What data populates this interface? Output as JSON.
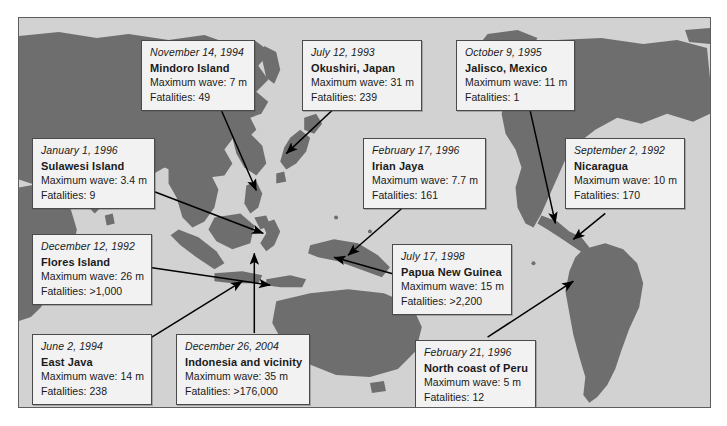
{
  "figure": {
    "type": "annotated-world-map",
    "title": "",
    "ocean_color": "#d2d2d2",
    "land_color": "#6e6e6e",
    "callout_bg": "#f2f2f2",
    "callout_border": "#4a4a4a",
    "arrow_color": "#000000",
    "page_bg": "#ffffff"
  },
  "labels": {
    "wave_prefix": "Maximum wave: ",
    "fatalities_prefix": "Fatalities: "
  },
  "events": [
    {
      "id": "mindoro-island",
      "date": "November 14, 1994",
      "place": "Mindoro Island",
      "wave_line": "Maximum wave: 7 m",
      "fatalities_line": "Fatalities: 49",
      "max_wave_m": 7,
      "fatalities": 49
    },
    {
      "id": "okushiri-japan",
      "date": "July 12, 1993",
      "place": "Okushiri, Japan",
      "wave_line": "Maximum wave: 31 m",
      "fatalities_line": "Fatalities: 239",
      "max_wave_m": 31,
      "fatalities": 239
    },
    {
      "id": "jalisco-mexico",
      "date": "October 9, 1995",
      "place": "Jalisco, Mexico",
      "wave_line": "Maximum wave: 11 m",
      "fatalities_line": "Fatalities: 1",
      "max_wave_m": 11,
      "fatalities": 1
    },
    {
      "id": "sulawesi-island",
      "date": "January 1, 1996",
      "place": "Sulawesi Island",
      "wave_line": "Maximum wave: 3.4 m",
      "fatalities_line": "Fatalities: 9",
      "max_wave_m": 3.4,
      "fatalities": 9
    },
    {
      "id": "irian-jaya",
      "date": "February 17, 1996",
      "place": "Irian Jaya",
      "wave_line": "Maximum wave: 7.7 m",
      "fatalities_line": "Fatalities: 161",
      "max_wave_m": 7.7,
      "fatalities": 161
    },
    {
      "id": "nicaragua",
      "date": "September 2, 1992",
      "place": "Nicaragua",
      "wave_line": "Maximum wave: 10 m",
      "fatalities_line": "Fatalities: 170",
      "max_wave_m": 10,
      "fatalities": 170
    },
    {
      "id": "flores-island",
      "date": "December 12, 1992",
      "place": "Flores Island",
      "wave_line": "Maximum wave: 26 m",
      "fatalities_line": "Fatalities: >1,000",
      "max_wave_m": 26,
      "fatalities": ">1,000"
    },
    {
      "id": "papua-new-guinea",
      "date": "July 17, 1998",
      "place": "Papua New Guinea",
      "wave_line": "Maximum wave: 15 m",
      "fatalities_line": "Fatalities: >2,200",
      "max_wave_m": 15,
      "fatalities": ">2,200"
    },
    {
      "id": "east-java",
      "date": "June 2, 1994",
      "place": "East Java",
      "wave_line": "Maximum wave: 14 m",
      "fatalities_line": "Fatalities: 238",
      "max_wave_m": 14,
      "fatalities": 238
    },
    {
      "id": "indonesia-and-vicinity",
      "date": "December 26, 2004",
      "place": "Indonesia and vicinity",
      "wave_line": "Maximum wave: 35 m",
      "fatalities_line": "Fatalities: >176,000",
      "max_wave_m": 35,
      "fatalities": ">176,000"
    },
    {
      "id": "north-coast-of-peru",
      "date": "February 21, 1996",
      "place": "North coast of Peru",
      "wave_line": "Maximum wave: 5 m",
      "fatalities_line": "Fatalities: 12",
      "max_wave_m": 5,
      "fatalities": 12
    }
  ]
}
